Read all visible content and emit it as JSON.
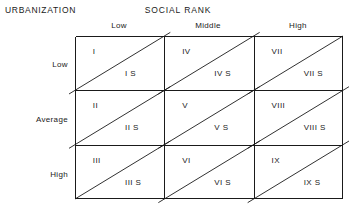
{
  "diagram": {
    "row_axis_title": "URBANIZATION",
    "col_axis_title": "SOCIAL RANK",
    "col_headers": [
      "Low",
      "Middle",
      "High"
    ],
    "row_headers": [
      "Low",
      "Average",
      "High"
    ],
    "grid": {
      "columns": 3,
      "rows": 3,
      "cell_split": "diagonal",
      "line_color": "#1a1a1a"
    },
    "cells": [
      {
        "upper": "I",
        "lower": "I S",
        "row": 0,
        "col": 0
      },
      {
        "upper": "IV",
        "lower": "IV S",
        "row": 0,
        "col": 1
      },
      {
        "upper": "VII",
        "lower": "VII S",
        "row": 0,
        "col": 2
      },
      {
        "upper": "II",
        "lower": "II S",
        "row": 1,
        "col": 0
      },
      {
        "upper": "V",
        "lower": "V S",
        "row": 1,
        "col": 1
      },
      {
        "upper": "VIII",
        "lower": "VIII S",
        "row": 1,
        "col": 2
      },
      {
        "upper": "III",
        "lower": "III S",
        "row": 2,
        "col": 0
      },
      {
        "upper": "VI",
        "lower": "VI S",
        "row": 2,
        "col": 1
      },
      {
        "upper": "IX",
        "lower": "IX S",
        "row": 2,
        "col": 2
      }
    ]
  }
}
